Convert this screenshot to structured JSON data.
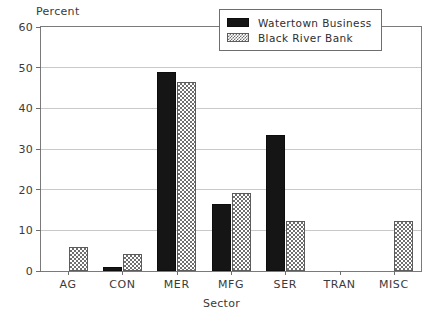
{
  "chart_data": {
    "type": "bar",
    "title": "",
    "subtitle": "",
    "xlabel": "Sector",
    "ylabel": "Percent",
    "categories": [
      "AG",
      "CON",
      "MER",
      "MFG",
      "SER",
      "TRAN",
      "MISC"
    ],
    "series": [
      {
        "name": "Watertown Business",
        "color": "#151515",
        "fill": "solid",
        "values": [
          0,
          1,
          49,
          16.5,
          33.5,
          0,
          0
        ]
      },
      {
        "name": "Black River Bank",
        "color": "#6f6f6f",
        "fill": "checkered-hatch",
        "values": [
          6,
          4.2,
          46.5,
          19.2,
          12.2,
          0,
          12.2
        ]
      }
    ],
    "ylim": [
      0,
      60
    ],
    "yticks": [
      0,
      10,
      20,
      30,
      40,
      50,
      60
    ],
    "ytick_labels": [
      "0",
      "10",
      "20",
      "30",
      "40",
      "50",
      "60"
    ],
    "grid": true,
    "grid_axis": "y",
    "legend_position": "top-right-inside",
    "legend_border": true
  },
  "legend": {
    "entries": [
      {
        "label": "Watertown Business"
      },
      {
        "label": "Black River Bank"
      }
    ]
  },
  "axes": {
    "y_title": "Percent",
    "x_title": "Sector"
  }
}
